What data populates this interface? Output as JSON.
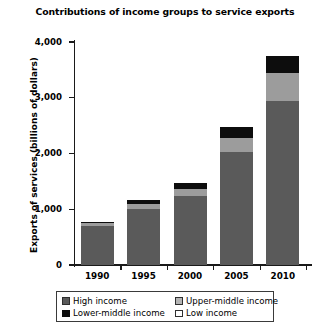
{
  "chart_data": {
    "type": "bar",
    "title": "Contributions of income groups to service exports",
    "xlabel": "",
    "ylabel": "Exports of services (billions of dollars)",
    "categories": [
      "1990",
      "1995",
      "2000",
      "2005",
      "2010"
    ],
    "ylim": [
      0,
      4000
    ],
    "yticks": [
      "0",
      "1,000",
      "2,000",
      "3,000",
      "4,000"
    ],
    "ytick_values": [
      0,
      1000,
      2000,
      3000,
      4000
    ],
    "grid": false,
    "stacked": true,
    "legend_position": "bottom",
    "series": [
      {
        "name": "High income",
        "color": "#5a5a5a",
        "values": [
          700,
          1000,
          1230,
          2030,
          2950
        ]
      },
      {
        "name": "Upper-middle income",
        "color": "#9c9c9c",
        "values": [
          45,
          90,
          130,
          250,
          500
        ]
      },
      {
        "name": "Lower-middle income",
        "color": "#0d0d0d",
        "values": [
          35,
          70,
          110,
          190,
          300
        ]
      },
      {
        "name": "Low income",
        "color": "#ffffff",
        "values": [
          0,
          0,
          0,
          0,
          0
        ]
      }
    ],
    "totals": [
      780,
      1160,
      1470,
      2470,
      3750
    ]
  },
  "legend": {
    "entries": [
      {
        "label": "High income",
        "swatch": "high-income-swatch"
      },
      {
        "label": "Upper-middle income",
        "swatch": "upper-middle-income-swatch"
      },
      {
        "label": "Lower-middle income",
        "swatch": "lower-middle-income-swatch"
      },
      {
        "label": "Low income",
        "swatch": "low-income-swatch"
      }
    ]
  }
}
